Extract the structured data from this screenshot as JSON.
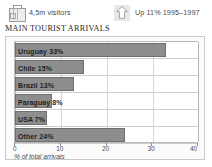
{
  "header": {
    "stats": [
      {
        "icon": "suitcase-icon",
        "label": "4,5m visitors"
      },
      {
        "icon": "up-arrow-icon",
        "label": "Up 11% 1995–1997"
      }
    ]
  },
  "title": "MAIN TOURIST ARRIVALS",
  "caption": "% of total arrivals",
  "colors": {
    "bar_fill": "#8d8d8d",
    "bar_border": "#6f6f6f",
    "panel_border": "#c9c9c9",
    "grid": "#d6d6d6"
  },
  "chart_data": {
    "type": "bar",
    "orientation": "horizontal",
    "title": "MAIN TOURIST ARRIVALS",
    "xlabel": "% of total arrivals",
    "ylabel": "",
    "xlim": [
      0,
      40
    ],
    "xticks": [
      0,
      10,
      20,
      30,
      40
    ],
    "xticklabels": [
      "0",
      "10",
      "20",
      "30",
      "40"
    ],
    "grid": true,
    "legend": false,
    "categories": [
      "Uruguay",
      "Chile",
      "Brazil",
      "Paraguay",
      "USA",
      "Other"
    ],
    "values": [
      33,
      15,
      13,
      8,
      7,
      24
    ],
    "bar_labels": [
      "Uruguay 33%",
      "Chile 15%",
      "Brazil 13%",
      "Paraguay 8%",
      "USA 7%",
      "Other  24%"
    ]
  }
}
